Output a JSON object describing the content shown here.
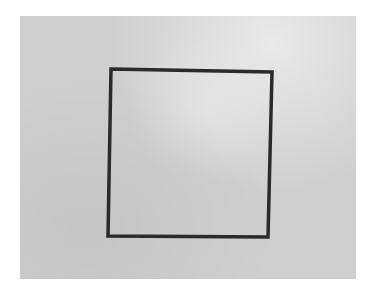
{
  "scene": {
    "description": "Photo of a hand-drawn square on a sheet of grey paper",
    "background_color": "#ffffff",
    "paper_color": "#cfcfcf",
    "ink_color": "#2a2a2a"
  },
  "square": {
    "corners": [
      [
        111,
        69
      ],
      [
        272,
        72
      ],
      [
        268,
        237
      ],
      [
        108,
        236
      ]
    ],
    "stroke_width": 3.5
  }
}
